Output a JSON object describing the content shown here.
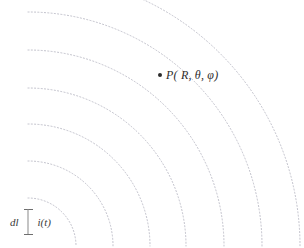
{
  "figure": {
    "type": "radiation-wavefront-diagram",
    "width": 304,
    "height": 248,
    "background_color": "#ffffff",
    "arc_color": "#b9b9c4",
    "marker_color": "#2b2b2b",
    "label_color": "#2e2e2e"
  },
  "field_point": {
    "label": "P( R, θ, φ)",
    "label_plain": "P(R, θ, φ)",
    "symbol": "P",
    "coordinates": [
      "R",
      "θ",
      "φ"
    ],
    "marker": "filled-dot",
    "x": 160,
    "y": 75
  },
  "source": {
    "length_label": "dl",
    "current_label": "i(t)",
    "element_name": "infinitesimal-current-element",
    "x": 10,
    "y": 209
  },
  "wavefronts": {
    "center_x": 28,
    "center_y": 246,
    "count": 7,
    "stroke_color": "#b9b9c4",
    "stroke_width": 0.9,
    "dash_pattern": "1.1 2.2",
    "radii": [
      48,
      85,
      122,
      158,
      196,
      234,
      272
    ]
  },
  "chart_data": {
    "type": "scatter",
    "title": "",
    "xlabel": "",
    "ylabel": "",
    "series": [
      {
        "name": "wavefront-arcs",
        "kind": "concentric-arcs",
        "center": [
          28,
          246
        ],
        "radii": [
          48,
          85,
          122,
          158,
          196,
          234,
          272
        ]
      },
      {
        "name": "field-point",
        "kind": "point",
        "x": [
          160
        ],
        "y": [
          75
        ],
        "labels": [
          "P( R, θ, φ)"
        ]
      },
      {
        "name": "source-element",
        "kind": "point",
        "x": [
          28
        ],
        "y": [
          222
        ],
        "labels": [
          "dl",
          "i(t)"
        ]
      }
    ],
    "annotations": [
      "P( R, θ, φ)",
      "dl",
      "i(t)"
    ],
    "grid": false,
    "legend": "none"
  }
}
